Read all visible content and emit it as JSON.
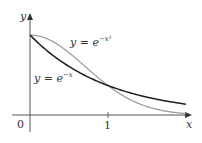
{
  "chart_data": {
    "type": "line",
    "title": "",
    "xlabel": "x",
    "ylabel": "y",
    "xlim": [
      0,
      2.05
    ],
    "ylim": [
      0,
      1.05
    ],
    "x_ticks": [
      {
        "value": 0,
        "label": "0"
      },
      {
        "value": 1,
        "label": "1"
      }
    ],
    "grid": false,
    "legend": "inline annotations",
    "series": [
      {
        "name": "y = e^{-x^2}",
        "label_base": "y = e",
        "label_exp": "−x²",
        "color": "#9a9a9a",
        "x": [
          0,
          0.25,
          0.5,
          0.75,
          1,
          1.25,
          1.5,
          1.75,
          2
        ],
        "values": [
          1,
          0.939,
          0.779,
          0.57,
          0.368,
          0.21,
          0.105,
          0.047,
          0.018
        ]
      },
      {
        "name": "y = e^{-x}",
        "label_base": "y = e",
        "label_exp": "−x",
        "color": "#1e1e1e",
        "x": [
          0,
          0.25,
          0.5,
          0.75,
          1,
          1.25,
          1.5,
          1.75,
          2
        ],
        "values": [
          1,
          0.779,
          0.607,
          0.472,
          0.368,
          0.287,
          0.223,
          0.174,
          0.135
        ]
      }
    ],
    "annotations": [
      {
        "text": "intersection at (1, 1/e)",
        "x": 1,
        "y": 0.368
      }
    ]
  },
  "axes": {
    "x_label": "x",
    "y_label": "y",
    "origin_label": "0",
    "tick_1_label": "1"
  }
}
